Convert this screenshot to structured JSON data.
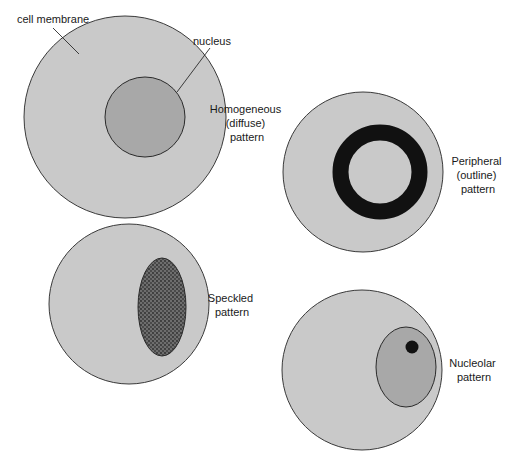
{
  "diagram": {
    "colors": {
      "cytoplasm": "#c9c9c9",
      "nucleus": "#a8a8a8",
      "stain": "#111111",
      "outline": "#3a3a3a",
      "background": "#ffffff"
    },
    "callouts": {
      "cell_membrane": "cell membrane",
      "nucleus": "nucleus"
    },
    "patterns": [
      {
        "id": "homogeneous",
        "lines": [
          "Homogeneous",
          "(diffuse)",
          "pattern"
        ]
      },
      {
        "id": "peripheral",
        "lines": [
          "Peripheral",
          "(outline)",
          "pattern"
        ]
      },
      {
        "id": "speckled",
        "lines": [
          "Speckled",
          "pattern"
        ]
      },
      {
        "id": "nucleolar",
        "lines": [
          "Nucleolar",
          "pattern"
        ]
      }
    ]
  }
}
